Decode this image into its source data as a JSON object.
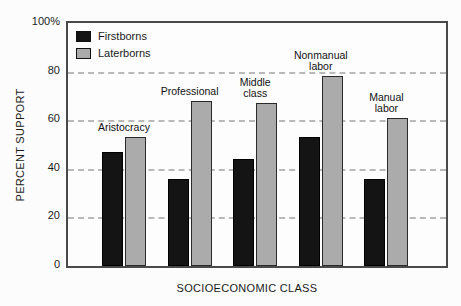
{
  "chart_data": {
    "type": "bar",
    "title": "",
    "categories": [
      "Aristocracy",
      "Professional",
      "Middle class",
      "Nonmanual labor",
      "Manual labor"
    ],
    "category_label_lines": [
      [
        "Aristocracy"
      ],
      [
        "Professional"
      ],
      [
        "Middle",
        "class"
      ],
      [
        "Nonmanual",
        "labor"
      ],
      [
        "Manual",
        "labor"
      ]
    ],
    "series": [
      {
        "name": "Firstborns",
        "color": "#141414",
        "values": [
          47,
          36,
          44,
          53,
          36
        ]
      },
      {
        "name": "Laterborns",
        "color": "#ababab",
        "values": [
          53,
          68,
          67,
          78,
          61
        ]
      }
    ],
    "xlabel": "SOCIOECONOMIC CLASS",
    "ylabel": "PERCENT SUPPORT",
    "ylim": [
      0,
      100
    ],
    "yticks": [
      {
        "value": 100,
        "label": "100%"
      },
      {
        "value": 80,
        "label": "80"
      },
      {
        "value": 60,
        "label": "60"
      },
      {
        "value": 40,
        "label": "40"
      },
      {
        "value": 20,
        "label": "20"
      },
      {
        "value": 0,
        "label": "0"
      }
    ],
    "gridlines": [
      80,
      60,
      40,
      20
    ],
    "grid_style": "dashed",
    "legend_position": "top-left"
  }
}
